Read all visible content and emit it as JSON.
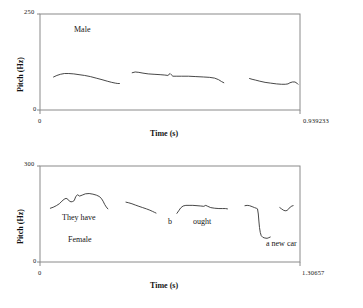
{
  "chart_data": [
    {
      "type": "line",
      "id": "male-pitch-contour",
      "title": "Male",
      "xlabel": "Time (s)",
      "ylabel": "Pitch (Hz)",
      "xlim": [
        0,
        0.939233
      ],
      "ylim": [
        0,
        250
      ],
      "xtick_labels": [
        "0",
        "0.939233"
      ],
      "ytick_labels": [
        "0",
        "250"
      ],
      "grid": false,
      "legend": "none",
      "annotations": [
        {
          "text": "Male",
          "x": 0.11,
          "y": 218
        }
      ],
      "series": [
        {
          "name": "segment-1",
          "x": [
            0.049,
            0.061,
            0.074,
            0.088,
            0.104,
            0.122,
            0.141,
            0.161,
            0.182,
            0.203,
            0.224,
            0.243,
            0.259,
            0.272,
            0.281,
            0.287
          ],
          "y": [
            86,
            90,
            93,
            95,
            95,
            94,
            92,
            90,
            87,
            83,
            79,
            75,
            72,
            70,
            69,
            69
          ]
        },
        {
          "name": "segment-2",
          "x": [
            0.333,
            0.344,
            0.357,
            0.372,
            0.391,
            0.412,
            0.434,
            0.451,
            0.462,
            0.47,
            0.474,
            0.48,
            0.492,
            0.511,
            0.536,
            0.563,
            0.59,
            0.613,
            0.631,
            0.645,
            0.656,
            0.664
          ],
          "y": [
            97,
            99,
            98,
            96,
            94,
            93,
            92,
            91,
            90,
            95,
            92,
            88,
            88,
            88,
            88,
            87,
            86,
            85,
            83,
            79,
            74,
            71
          ]
        },
        {
          "name": "segment-3",
          "x": [
            0.757,
            0.766,
            0.778,
            0.794,
            0.813,
            0.833,
            0.854,
            0.872,
            0.886,
            0.896,
            0.903,
            0.912,
            0.921,
            0.928,
            0.932
          ],
          "y": [
            82,
            80,
            78,
            75,
            72,
            70,
            68,
            67,
            67,
            68,
            71,
            73,
            73,
            70,
            67
          ]
        }
      ]
    },
    {
      "type": "line",
      "id": "female-pitch-contour",
      "title": "Female",
      "xlabel": "Time (s)",
      "ylabel": "Pitch (Hz)",
      "xlim": [
        0,
        1.30657
      ],
      "ylim": [
        0,
        300
      ],
      "xtick_labels": [
        "0",
        "1.30657"
      ],
      "ytick_labels": [
        "0",
        "300"
      ],
      "grid": false,
      "legend": "none",
      "annotations": [
        {
          "text": "They have",
          "x": 0.12,
          "y": 118
        },
        {
          "text": "b",
          "x": 0.6,
          "y": 110
        },
        {
          "text": "ought",
          "x": 0.7,
          "y": 110
        },
        {
          "text": "Female",
          "x": 0.14,
          "y": 78
        },
        {
          "text": "a new car",
          "x": 0.95,
          "y": 58
        }
      ],
      "series": [
        {
          "name": "segment-1",
          "x": [
            0.052,
            0.066,
            0.082,
            0.097,
            0.11,
            0.121,
            0.131,
            0.14,
            0.148,
            0.156,
            0.164,
            0.172,
            0.18,
            0.189,
            0.199,
            0.212,
            0.228,
            0.247,
            0.266,
            0.283,
            0.297,
            0.308,
            0.317,
            0.325,
            0.333,
            0.341
          ],
          "y": [
            168,
            171,
            176,
            182,
            190,
            196,
            199,
            196,
            190,
            188,
            189,
            192,
            205,
            210,
            206,
            209,
            213,
            214,
            212,
            209,
            205,
            199,
            190,
            180,
            172,
            166
          ]
        },
        {
          "name": "segment-2",
          "x": [
            0.432,
            0.446,
            0.462,
            0.479,
            0.497,
            0.516,
            0.535,
            0.552,
            0.566,
            0.576,
            0.583
          ],
          "y": [
            187,
            185,
            182,
            178,
            174,
            170,
            166,
            162,
            158,
            155,
            153
          ]
        },
        {
          "name": "segment-3",
          "x": [
            0.688,
            0.697,
            0.707,
            0.719,
            0.733,
            0.749,
            0.768,
            0.789,
            0.808,
            0.823,
            0.833,
            0.843,
            0.858,
            0.878,
            0.899,
            0.918,
            0.932,
            0.942
          ],
          "y": [
            152,
            160,
            169,
            175,
            177,
            177,
            177,
            176,
            175,
            174,
            177,
            174,
            170,
            168,
            167,
            167,
            167,
            166
          ]
        },
        {
          "name": "segment-4",
          "x": [
            1.03,
            1.041,
            1.053,
            1.066,
            1.078,
            1.087,
            1.093,
            1.097,
            1.1,
            1.103,
            1.107,
            1.112,
            1.12,
            1.13,
            1.141,
            1.15,
            1.157
          ],
          "y": [
            176,
            177,
            176,
            173,
            170,
            168,
            166,
            150,
            128,
            108,
            92,
            82,
            77,
            75,
            74,
            76,
            78
          ]
        },
        {
          "name": "segment-5",
          "x": [
            1.205,
            1.214,
            1.223,
            1.232,
            1.241,
            1.25,
            1.258,
            1.266,
            1.272
          ],
          "y": [
            170,
            166,
            162,
            160,
            161,
            166,
            172,
            175,
            176
          ]
        }
      ]
    }
  ],
  "male_panel": {
    "y_max_tick": "250",
    "y_min_tick": "0",
    "x_min_tick": "0",
    "x_max_tick": "0.939233",
    "x_axis_title": "Time (s)",
    "y_axis_title": "Pitch (Hz)",
    "speaker_note": "Male"
  },
  "female_panel": {
    "y_max_tick": "300",
    "y_min_tick": "0",
    "x_min_tick": "0",
    "x_max_tick": "1.30657",
    "x_axis_title": "Time (s)",
    "y_axis_title": "Pitch (Hz)",
    "speaker_note": "Female",
    "utterance_1": "They have",
    "utterance_2": "b",
    "utterance_3": "ought",
    "utterance_4": "a new car"
  },
  "colors": {
    "frame": "#8a8a8a",
    "trace": "#333333",
    "text": "#151515",
    "background": "#ffffff"
  }
}
